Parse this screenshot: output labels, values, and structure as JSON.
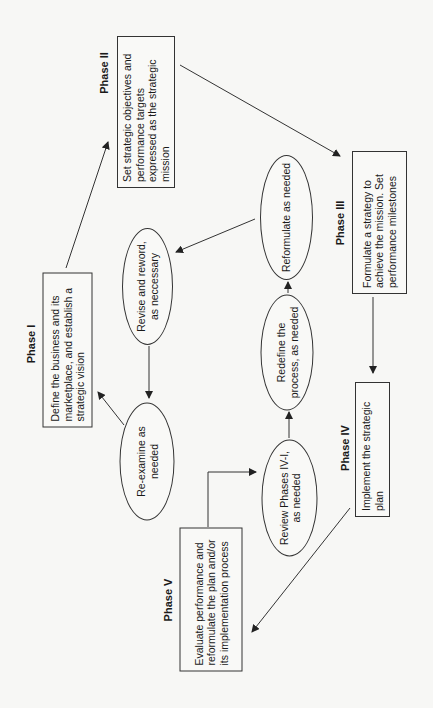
{
  "diagram": {
    "orientation": "rotated-90-ccw",
    "phases": [
      {
        "id": "phase-1",
        "label": "Phase I",
        "text": "Define the business and its marketplace, and establish a strategic vision"
      },
      {
        "id": "phase-2",
        "label": "Phase II",
        "text": "Set strategic objectives and performance targets expressed as the strategic mission"
      },
      {
        "id": "phase-3",
        "label": "Phase III",
        "text": "Formulate a strategy to achieve the mission. Set performance milestones"
      },
      {
        "id": "phase-4",
        "label": "Phase IV",
        "text": "Implement the strategic plan"
      },
      {
        "id": "phase-5",
        "label": "Phase V",
        "text": "Evaluate performance and reformulate the plan and/or its implementation process"
      }
    ],
    "feedback": [
      {
        "id": "review",
        "text": "Review Phases IV-I, as needed"
      },
      {
        "id": "redefine",
        "text": "Redefine the process, as needed"
      },
      {
        "id": "reformulate",
        "text": "Reformulate as needed"
      },
      {
        "id": "revise",
        "text": "Revise and reword, as neccessary"
      },
      {
        "id": "reexamine",
        "text": "Re-examine as needed"
      }
    ],
    "edges": [
      [
        "phase-1",
        "phase-2"
      ],
      [
        "phase-2",
        "phase-3"
      ],
      [
        "phase-3",
        "phase-4"
      ],
      [
        "phase-4",
        "phase-5"
      ],
      [
        "phase-5",
        "review"
      ],
      [
        "review",
        "redefine"
      ],
      [
        "redefine",
        "reformulate"
      ],
      [
        "reformulate",
        "revise"
      ],
      [
        "revise",
        "reexamine"
      ],
      [
        "reexamine",
        "phase-1"
      ]
    ],
    "colors": {
      "line": "#333333",
      "background": "#f7f7f5"
    }
  }
}
